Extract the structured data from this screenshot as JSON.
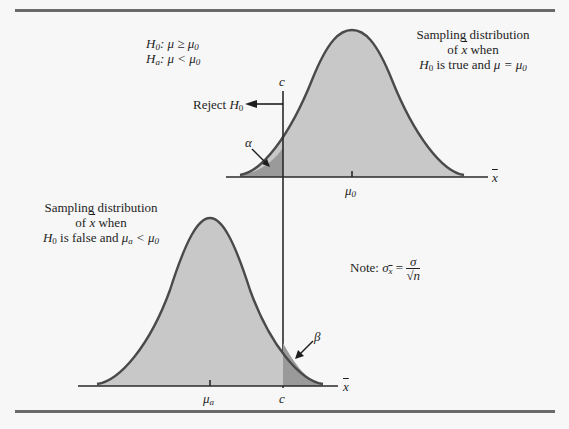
{
  "figure": {
    "hypotheses": {
      "h0": {
        "symbol": "H",
        "sub": "0",
        "relation": ": μ ≥ μ",
        "rhs_sub": "0"
      },
      "ha": {
        "symbol": "H",
        "sub": "a",
        "relation": ": μ < μ",
        "rhs_sub": "0"
      }
    },
    "top_caption": {
      "line1": "Sampling distribution",
      "line2_prefix": "of ",
      "line2_var": "x",
      "line2_suffix": " when",
      "line3_h": "H",
      "line3_hsub": "0",
      "line3_mid": " is true and ",
      "line3_mu": "μ = μ",
      "line3_musub": "0"
    },
    "reject_label": {
      "text": "Reject ",
      "h": "H",
      "sub": "0"
    },
    "critical_value_label": "c",
    "alpha_label": "α",
    "beta_label": "β",
    "top_axis": {
      "tick_label": "μ",
      "tick_sub": "0",
      "axis_label": "x"
    },
    "bottom_caption": {
      "line1": "Sampling distribution",
      "line2_prefix": "of ",
      "line2_var": "x",
      "line2_suffix": " when",
      "line3_h": "H",
      "line3_hsub": "0",
      "line3_mid": " is false and ",
      "line3_mu": "μ",
      "line3_musub": "a",
      "line3_rel": " < μ",
      "line3_relsub": "0"
    },
    "note": {
      "prefix": "Note:  ",
      "lhs": "σ",
      "lhs_sub": "x",
      "eq": " = ",
      "num": "σ",
      "den": "√n"
    },
    "bottom_axis": {
      "tick_label": "μ",
      "tick_sub": "a",
      "c_label": "c",
      "axis_label": "x"
    },
    "colors": {
      "curve_fill": "#c8c8c8",
      "tail_fill": "#9a9a9a",
      "curve_stroke": "#4a4a4a",
      "axis": "#2a2a2a",
      "rule": "#6a6a6a"
    }
  }
}
